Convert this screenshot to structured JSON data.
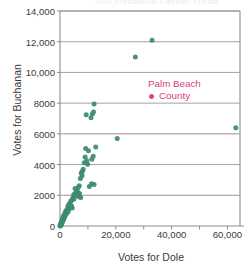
{
  "figure": {
    "cut_title": "2000 Presidential Election, Florida",
    "xlabel": "Votes for Dole",
    "ylabel": "Votes for Buchanan",
    "annotation_line1": "Palm Beach",
    "annotation_line2": "County",
    "point_color": "#3d8a72",
    "annotation_color": "#d6407f"
  },
  "chart_data": {
    "type": "scatter",
    "title": "",
    "xlabel": "Votes for Dole",
    "ylabel": "Votes for Buchanan",
    "xlim": [
      0,
      64500
    ],
    "ylim": [
      0,
      14000
    ],
    "xticks": [
      0,
      20000,
      40000,
      60000
    ],
    "xticklabels": [
      "0",
      "20,000",
      "40,000",
      "60,000"
    ],
    "yticks": [
      0,
      2000,
      4000,
      6000,
      8000,
      10000,
      12000,
      14000
    ],
    "yticklabels": [
      "0",
      "2000",
      "4000",
      "6000",
      "8000",
      "10,000",
      "12,000",
      "14,000"
    ],
    "grid": "horizontal",
    "legend": "none",
    "annotations": [
      {
        "text": "Palm Beach County",
        "x": 30000,
        "y": 9000,
        "color": "#d6407f"
      }
    ],
    "series": [
      {
        "name": "Florida counties",
        "color": "#3d8a72",
        "points": [
          [
            33000,
            12100
          ],
          [
            27000,
            11000
          ],
          [
            12200,
            7950
          ],
          [
            9400,
            7250
          ],
          [
            11100,
            7050
          ],
          [
            11600,
            7300
          ],
          [
            12000,
            7420
          ],
          [
            63000,
            6400
          ],
          [
            20500,
            5700
          ],
          [
            12800,
            5150
          ],
          [
            9200,
            5050
          ],
          [
            10200,
            4900
          ],
          [
            11900,
            4550
          ],
          [
            11400,
            4350
          ],
          [
            9000,
            4500
          ],
          [
            9600,
            4250
          ],
          [
            8700,
            4120
          ],
          [
            9900,
            4020
          ],
          [
            8300,
            3700
          ],
          [
            8000,
            3550
          ],
          [
            7600,
            3450
          ],
          [
            7900,
            3280
          ],
          [
            7300,
            3100
          ],
          [
            11300,
            2750
          ],
          [
            12200,
            2700
          ],
          [
            10500,
            2580
          ],
          [
            6900,
            2620
          ],
          [
            6500,
            2500
          ],
          [
            5400,
            2450
          ],
          [
            6100,
            2300
          ],
          [
            5800,
            2230
          ],
          [
            6400,
            2180
          ],
          [
            7000,
            2120
          ],
          [
            5200,
            2080
          ],
          [
            4900,
            2020
          ],
          [
            6200,
            1980
          ],
          [
            6800,
            1900
          ],
          [
            7400,
            1850
          ],
          [
            4600,
            1820
          ],
          [
            5000,
            1760
          ],
          [
            4300,
            1700
          ],
          [
            3900,
            1620
          ],
          [
            3500,
            1480
          ],
          [
            3100,
            1380
          ],
          [
            4100,
            1320
          ],
          [
            2800,
            1250
          ],
          [
            4400,
            1180
          ],
          [
            3300,
            1120
          ],
          [
            2500,
            1060
          ],
          [
            2100,
            980
          ],
          [
            2900,
            920
          ],
          [
            1800,
            860
          ],
          [
            2300,
            800
          ],
          [
            1500,
            740
          ],
          [
            1900,
            690
          ],
          [
            1200,
            620
          ],
          [
            1600,
            570
          ],
          [
            1000,
            510
          ],
          [
            1350,
            470
          ],
          [
            800,
            420
          ],
          [
            1100,
            380
          ],
          [
            600,
            330
          ],
          [
            900,
            290
          ],
          [
            450,
            250
          ],
          [
            700,
            210
          ],
          [
            350,
            170
          ],
          [
            550,
            140
          ],
          [
            250,
            110
          ],
          [
            400,
            85
          ],
          [
            150,
            60
          ],
          [
            300,
            45
          ],
          [
            100,
            30
          ],
          [
            200,
            20
          ],
          [
            60,
            12
          ]
        ]
      }
    ]
  }
}
